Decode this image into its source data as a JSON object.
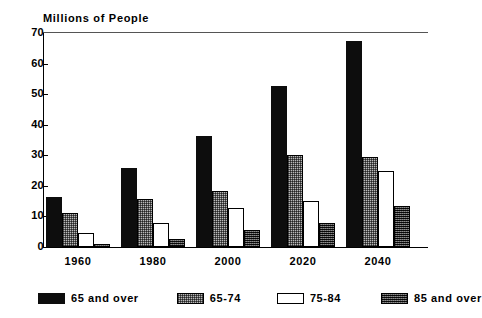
{
  "chart_data": {
    "type": "bar",
    "title": "Millions of People",
    "xlabel": "",
    "ylabel": "Millions of People",
    "ylim": [
      0,
      70
    ],
    "yticks": [
      0,
      10,
      20,
      30,
      40,
      50,
      60,
      70
    ],
    "grid": false,
    "legend_position": "bottom",
    "categories": [
      "1960",
      "1980",
      "2000",
      "2020",
      "2040"
    ],
    "series": [
      {
        "name": "65 and over",
        "style": "solid-black",
        "color": "#0d0d0d",
        "values": [
          16.5,
          25.8,
          36.3,
          52.6,
          67.5
        ]
      },
      {
        "name": "65-74",
        "style": "light-stipple",
        "color": "#b9b9b9",
        "values": [
          11.1,
          15.7,
          18.4,
          30.2,
          29.5
        ]
      },
      {
        "name": "75-84",
        "style": "white-open",
        "color": "#ffffff",
        "values": [
          4.6,
          7.8,
          12.6,
          15.1,
          24.9
        ]
      },
      {
        "name": "85 and over",
        "style": "dark-stipple",
        "color": "#4a4a4a",
        "values": [
          0.9,
          2.6,
          5.5,
          7.9,
          13.4
        ]
      }
    ]
  },
  "axes": {
    "y_tick_labels": [
      "70",
      "60",
      "50",
      "40",
      "30",
      "20",
      "10",
      "0"
    ],
    "x_tick_labels": [
      "1960",
      "1980",
      "2000",
      "2020",
      "2040"
    ]
  },
  "legend": {
    "items": [
      {
        "label": "65 and over",
        "style": "solid-black"
      },
      {
        "label": "65-74",
        "style": "light-stipple"
      },
      {
        "label": "75-84",
        "style": "white-open"
      },
      {
        "label": "85 and over",
        "style": "dark-stipple"
      }
    ]
  }
}
